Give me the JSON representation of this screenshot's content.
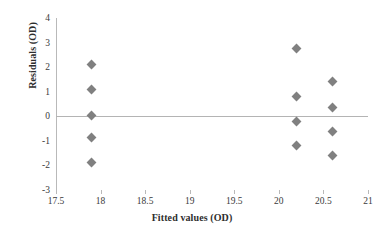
{
  "chart_data": {
    "type": "scatter",
    "title": "",
    "xlabel": "Fitted values (OD)",
    "ylabel": "Residuals (OD)",
    "xlim": [
      17.5,
      21
    ],
    "ylim": [
      -3,
      4
    ],
    "xticks": [
      "17.5",
      "18",
      "18.5",
      "19",
      "19.5",
      "20",
      "20.5",
      "21"
    ],
    "xtick_values": [
      17.5,
      18,
      18.5,
      19,
      19.5,
      20,
      20.5,
      21
    ],
    "yticks": [
      "4",
      "3",
      "2",
      "1",
      "0",
      "-1",
      "-2",
      "-3"
    ],
    "ytick_values": [
      4,
      3,
      2,
      1,
      0,
      -1,
      -2,
      -3
    ],
    "grid": false,
    "legend": false,
    "reference_line": 0,
    "marker": "diamond",
    "marker_color": "#808080",
    "axis_color": "#b9b9b9",
    "points": [
      {
        "x": 17.9,
        "y": 2.1
      },
      {
        "x": 17.9,
        "y": 1.1
      },
      {
        "x": 17.9,
        "y": 0.05
      },
      {
        "x": 17.9,
        "y": -0.85
      },
      {
        "x": 17.9,
        "y": -1.9
      },
      {
        "x": 20.2,
        "y": 2.75
      },
      {
        "x": 20.2,
        "y": 0.8
      },
      {
        "x": 20.2,
        "y": -0.2
      },
      {
        "x": 20.2,
        "y": -1.2
      },
      {
        "x": 20.6,
        "y": 1.4
      },
      {
        "x": 20.6,
        "y": 0.35
      },
      {
        "x": 20.6,
        "y": -0.6
      },
      {
        "x": 20.6,
        "y": -1.6
      }
    ]
  }
}
